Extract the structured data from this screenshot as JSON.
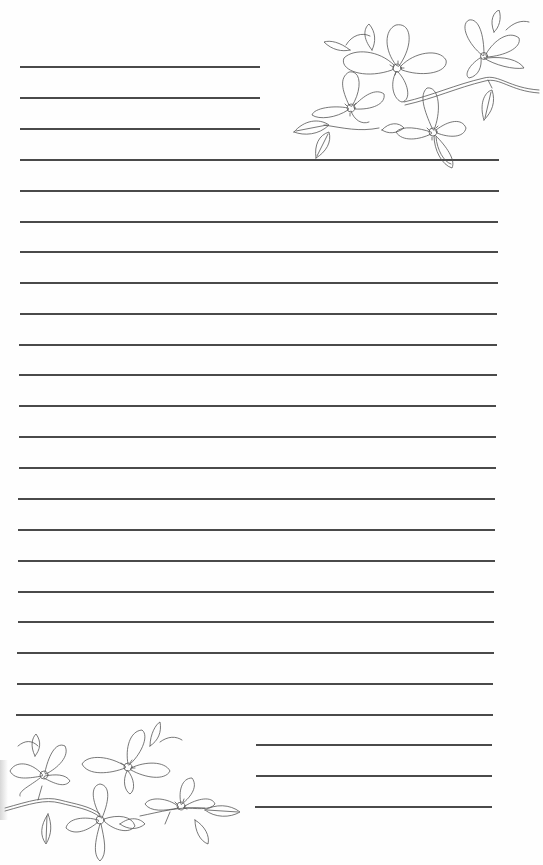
{
  "page": {
    "type": "lined-stationery",
    "background": "#fefefe",
    "line_color": "#4a4a4a",
    "line_spacing_px": 31
  },
  "top_short_lines": [
    {
      "y": 66,
      "x1": 20,
      "x2": 260
    },
    {
      "y": 97,
      "x1": 20,
      "x2": 260
    },
    {
      "y": 128,
      "x1": 20,
      "x2": 260
    }
  ],
  "full_lines": [
    {
      "y": 159,
      "x1": 20,
      "x2": 499
    },
    {
      "y": 190,
      "x1": 20,
      "x2": 499
    },
    {
      "y": 221,
      "x1": 20,
      "x2": 498
    },
    {
      "y": 251,
      "x1": 20,
      "x2": 498
    },
    {
      "y": 282,
      "x1": 20,
      "x2": 498
    },
    {
      "y": 313,
      "x1": 20,
      "x2": 497
    },
    {
      "y": 344,
      "x1": 19,
      "x2": 497
    },
    {
      "y": 374,
      "x1": 19,
      "x2": 497
    },
    {
      "y": 405,
      "x1": 19,
      "x2": 496
    },
    {
      "y": 436,
      "x1": 19,
      "x2": 496
    },
    {
      "y": 467,
      "x1": 19,
      "x2": 496
    },
    {
      "y": 498,
      "x1": 18,
      "x2": 495
    },
    {
      "y": 529,
      "x1": 18,
      "x2": 495
    },
    {
      "y": 560,
      "x1": 18,
      "x2": 495
    },
    {
      "y": 591,
      "x1": 18,
      "x2": 494
    },
    {
      "y": 621,
      "x1": 18,
      "x2": 494
    },
    {
      "y": 652,
      "x1": 17,
      "x2": 494
    },
    {
      "y": 683,
      "x1": 17,
      "x2": 493
    },
    {
      "y": 714,
      "x1": 16,
      "x2": 493
    }
  ],
  "bottom_short_lines": [
    {
      "y": 744,
      "x1": 256,
      "x2": 492
    },
    {
      "y": 775,
      "x1": 256,
      "x2": 492
    },
    {
      "y": 806,
      "x1": 255,
      "x2": 492
    }
  ],
  "decorations": {
    "top_right": "dogwood-flower-branch-icon",
    "bottom_left": "dogwood-flower-branch-icon"
  }
}
